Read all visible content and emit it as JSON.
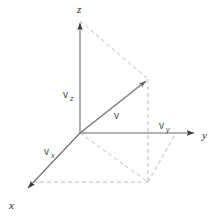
{
  "figure": {
    "background_color": "#ffffff",
    "axis_color": "#555555",
    "vector_color": "#6a6a6a",
    "dashed_color": "#b4b4b4",
    "label_color": "#2b2b2b"
  },
  "axes": [
    {
      "id": "z",
      "label": "z",
      "label_x": 77,
      "label_y": 13,
      "from_x": 80,
      "from_y": 133,
      "to_x": 80,
      "to_y": 21
    },
    {
      "id": "y",
      "label": "y",
      "label_x": 202,
      "label_y": 139,
      "from_x": 80,
      "from_y": 133,
      "to_x": 196,
      "to_y": 133
    },
    {
      "id": "x",
      "label": "x",
      "label_x": 9,
      "label_y": 209,
      "from_x": 80,
      "from_y": 133,
      "to_x": 26,
      "to_y": 190
    }
  ],
  "vector": {
    "name": "v",
    "label": "v",
    "label_x": 114,
    "label_y": 119,
    "from_x": 80,
    "from_y": 133,
    "to_x": 148,
    "to_y": 79
  },
  "components": [
    {
      "id": "vz",
      "base": "v",
      "subscript": "z",
      "label_x": 63,
      "label_y": 98,
      "sub_dx": 7,
      "sub_dy": 3
    },
    {
      "id": "vy",
      "base": "v",
      "subscript": "y",
      "label_x": 159,
      "label_y": 129,
      "sub_dx": 7,
      "sub_dy": 3
    },
    {
      "id": "vx",
      "base": "v",
      "subscript": "x",
      "label_x": 44,
      "label_y": 155,
      "sub_dx": 7,
      "sub_dy": 3
    }
  ],
  "dashed_lines": [
    {
      "id": "z-tip-to-v-tip",
      "x1": 80,
      "y1": 21,
      "x2": 148,
      "y2": 79
    },
    {
      "id": "v-tip-to-floor",
      "x1": 148,
      "y1": 79,
      "x2": 148,
      "y2": 182
    },
    {
      "id": "x-tip-to-floor-corner",
      "x1": 33,
      "y1": 182,
      "x2": 148,
      "y2": 182
    },
    {
      "id": "origin-to-floor-corner",
      "x1": 80,
      "y1": 133,
      "x2": 148,
      "y2": 182
    },
    {
      "id": "floor-corner-to-y-axis",
      "x1": 148,
      "y1": 182,
      "x2": 176,
      "y2": 133
    }
  ],
  "geometry": {
    "origin_x": 80,
    "origin_y": 133,
    "canvas_width": 218,
    "canvas_height": 218
  }
}
